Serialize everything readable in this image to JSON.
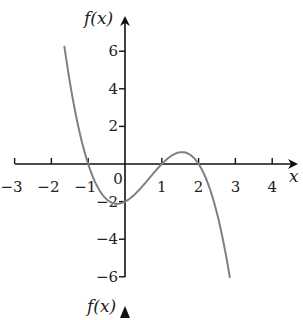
{
  "chart_data": {
    "type": "line",
    "title": "",
    "xlabel": "x",
    "ylabel": "f(x)",
    "bottom_label": "f(x)",
    "xlim": [
      -3,
      4.6
    ],
    "ylim": [
      -6,
      7
    ],
    "x_ticks": [
      -3,
      -2,
      -1,
      0,
      1,
      2,
      3,
      4
    ],
    "x_tick_labels": [
      "−3",
      "−2",
      "−1",
      "0",
      "1",
      "2",
      "3",
      "4"
    ],
    "y_ticks": [
      6,
      4,
      2,
      -2,
      -4,
      -6
    ],
    "y_tick_labels": [
      "6",
      "4",
      "2",
      "−2",
      "−4",
      "−6"
    ],
    "grid": false,
    "legend": null,
    "series": [
      {
        "name": "f(x)",
        "function": "-(x+1)(x-1)(x-2)",
        "x": [
          -1.65,
          -1.5,
          -1.25,
          -1,
          -0.75,
          -0.5,
          -0.25,
          0,
          0.25,
          0.5,
          0.75,
          1,
          1.25,
          1.5,
          1.75,
          2,
          2.25,
          2.5,
          2.75,
          2.85
        ],
        "y": [
          6.0,
          4.38,
          2.04,
          0,
          -1.48,
          -2.19,
          -2.23,
          -2.0,
          -1.64,
          -1.13,
          -0.55,
          0,
          0.42,
          0.63,
          0.52,
          0,
          -1.08,
          -2.63,
          -5.06,
          -5.8
        ],
        "color": "#808080"
      }
    ],
    "roots": [
      -1,
      1,
      2
    ],
    "y_intercept": -2
  }
}
